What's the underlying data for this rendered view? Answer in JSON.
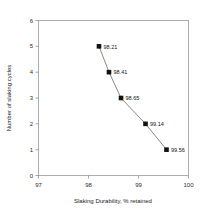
{
  "chart_data": {
    "type": "line",
    "title": "",
    "subtitle": "",
    "xlabel": "Slaking Durability, % retained",
    "ylabel": "Number of slaking cycles",
    "xlim": [
      97,
      100
    ],
    "ylim": [
      0,
      6
    ],
    "xticks": [
      97,
      98,
      99,
      100
    ],
    "yticks": [
      0,
      1,
      2,
      3,
      4,
      5,
      6
    ],
    "xtick_labels": [
      "97",
      "98",
      "99",
      "100"
    ],
    "ytick_labels": [
      "0",
      "1",
      "2",
      "3",
      "4",
      "5",
      "6"
    ],
    "grid": false,
    "legend": null,
    "legend_position": "none",
    "marker": "square",
    "marker_color": "#111111",
    "line_color": "#6b6b6b",
    "frame_color": "#9a9a9a",
    "series": [
      {
        "name": "Slaking durability vs cycles",
        "x": [
          98.21,
          98.41,
          98.65,
          99.14,
          99.56
        ],
        "y": [
          5,
          4,
          3,
          2,
          1
        ],
        "point_labels": [
          "98.21",
          "98.41",
          "98.65",
          "99.14",
          "99.56"
        ]
      }
    ]
  }
}
